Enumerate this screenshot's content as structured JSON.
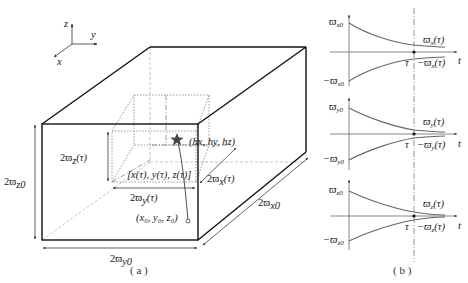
{
  "figure": {
    "panel_a": {
      "caption": "( a )",
      "axes": {
        "z": "z",
        "y": "y",
        "x": "x"
      },
      "outer_box": {
        "height_label": "2ϖ",
        "height_sub": "z0",
        "width_label": "2ϖ",
        "width_sub": "y0",
        "depth_label": "2ϖ",
        "depth_sub": "x0"
      },
      "inner_box": {
        "height_label": "2ϖ",
        "height_sub": "z",
        "height_arg": "(τ)",
        "width_label": "2ϖ",
        "width_sub": "y",
        "width_arg": "(τ)",
        "depth_label": "2ϖ",
        "depth_sub": "x",
        "depth_arg": "(τ)",
        "center_label": "[x(τ), y(τ), z(τ)]"
      },
      "target_point": "(hx, hy, hz)",
      "start_point": "(x₀, y₀, z₀)"
    },
    "panel_b": {
      "caption": "( b )",
      "plots": [
        {
          "y_top": "ϖ",
          "top_sub": "x0",
          "y_bottom": "−ϖ",
          "bottom_sub": "x0",
          "curve_upper": "ϖ",
          "upper_sub": "x",
          "upper_arg": "(τ)",
          "curve_lower": "−ϖ",
          "lower_sub": "x",
          "lower_arg": "(τ)",
          "tau": "τ",
          "t": "t"
        },
        {
          "y_top": "ϖ",
          "top_sub": "y0",
          "y_bottom": "−ϖ",
          "bottom_sub": "y0",
          "curve_upper": "ϖ",
          "upper_sub": "y",
          "upper_arg": "(τ)",
          "curve_lower": "−ϖ",
          "lower_sub": "y",
          "lower_arg": "(τ)",
          "tau": "τ",
          "t": "t"
        },
        {
          "y_top": "ϖ",
          "top_sub": "z0",
          "y_bottom": "−ϖ",
          "bottom_sub": "z0",
          "curve_upper": "ϖ",
          "upper_sub": "z",
          "upper_arg": "(τ)",
          "curve_lower": "−ϖ",
          "lower_sub": "z",
          "lower_arg": "(τ)",
          "tau": "τ",
          "t": "t"
        }
      ]
    }
  }
}
